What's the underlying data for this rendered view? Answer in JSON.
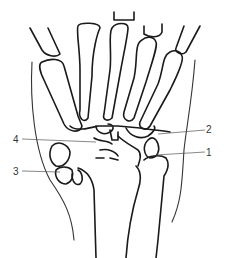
{
  "figure": {
    "type": "anatomical line drawing",
    "stroke_color": "#1a1a1a",
    "background": "#ffffff"
  },
  "labels": [
    {
      "id": "1",
      "text": "1",
      "side": "right"
    },
    {
      "id": "2",
      "text": "2",
      "side": "right"
    },
    {
      "id": "3",
      "text": "3",
      "side": "left"
    },
    {
      "id": "4",
      "text": "4",
      "side": "left"
    }
  ]
}
